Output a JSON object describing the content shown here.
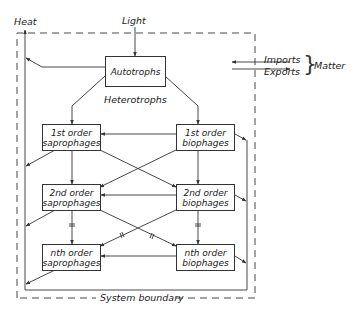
{
  "diagram": {
    "labels": {
      "heat": "Heat",
      "light": "Light",
      "heterotrophs": "Heterotrophs",
      "imports": "Imports",
      "exports": "Exports",
      "matter": "Matter",
      "system_boundary": "System boundary"
    },
    "nodes": {
      "autotrophs": {
        "line1": "Autotrophs"
      },
      "sapro1": {
        "line1": "1st order",
        "line2": "saprophages"
      },
      "bio1": {
        "line1": "1st order",
        "line2": "biophages"
      },
      "sapro2": {
        "line1": "2nd order",
        "line2": "saprophages"
      },
      "bio2": {
        "line1": "2nd order",
        "line2": "biophages"
      },
      "sapron": {
        "line1": "nth order",
        "line2": "saprophages"
      },
      "bion": {
        "line1": "nth order",
        "line2": "biophages"
      }
    },
    "colors": {
      "line": "#333333",
      "background": "#ffffff"
    }
  }
}
